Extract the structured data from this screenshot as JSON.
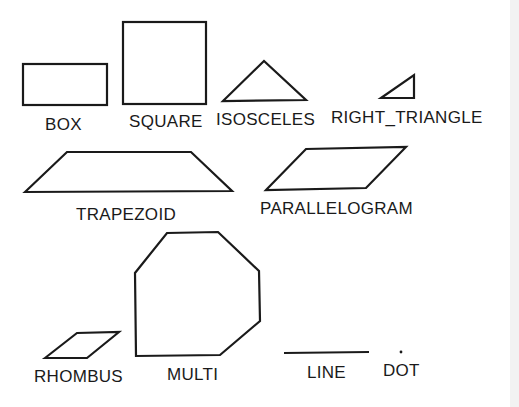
{
  "diagram": {
    "labels": {
      "box": "BOX",
      "square": "SQUARE",
      "isosceles": "ISOSCELES",
      "right_triangle": "RIGHT_TRIANGLE",
      "trapezoid": "TRAPEZOID",
      "parallelogram": "PARALLELOGRAM",
      "rhombus": "RHOMBUS",
      "multi": "MULTI",
      "line": "LINE",
      "dot": "DOT"
    }
  }
}
